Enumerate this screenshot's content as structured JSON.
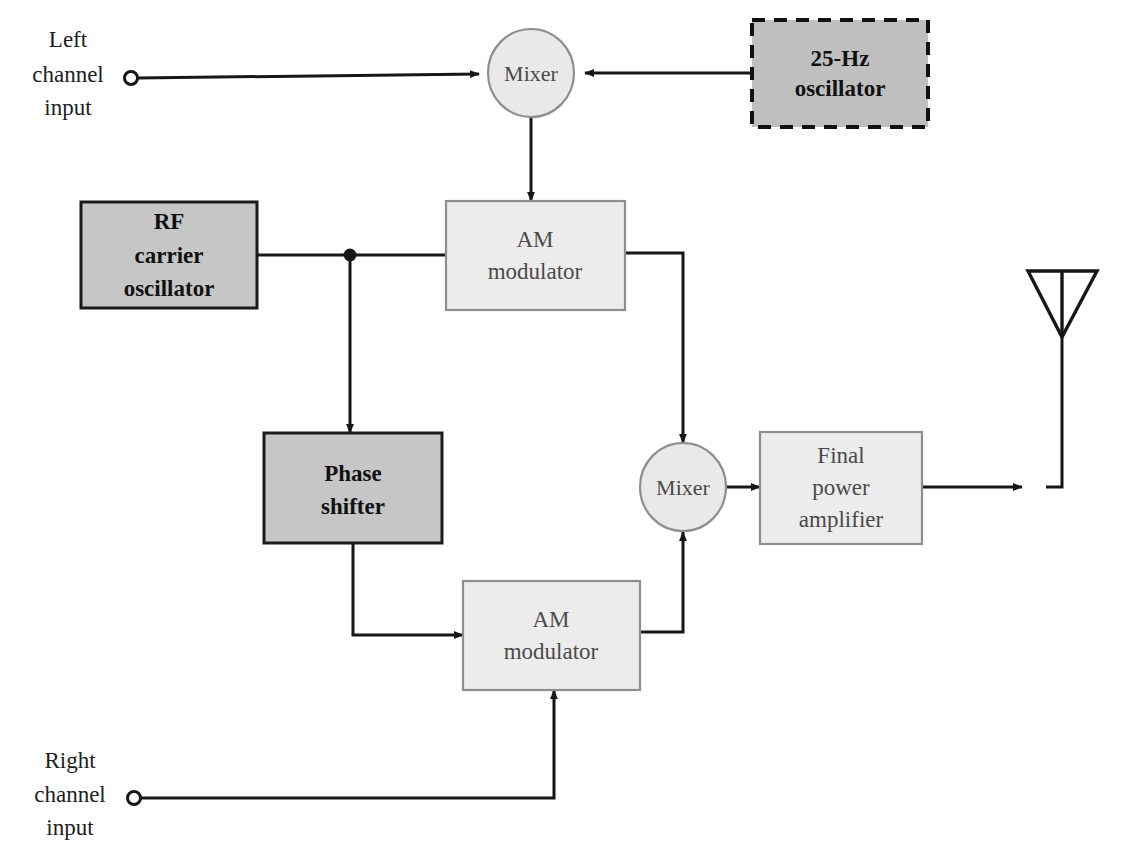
{
  "diagram": {
    "background_color": "#ffffff",
    "colors": {
      "dark_block_fill": "#c6c6c6",
      "dark_block_stroke": "#1a1a1a",
      "light_block_fill": "#ececec",
      "light_block_stroke": "#8e8e8e",
      "wire": "#161616",
      "dark_text": "#111111",
      "light_text": "#4a4a4a"
    },
    "inputs": [
      {
        "id": "left-channel-input",
        "lines": [
          "Left",
          "channel",
          "input"
        ],
        "terminal": {
          "x": 131,
          "y": 78
        }
      },
      {
        "id": "right-channel-input",
        "lines": [
          "Right",
          "channel",
          "input"
        ],
        "terminal": {
          "x": 134,
          "y": 798
        }
      }
    ],
    "blocks": [
      {
        "id": "oscillator-25hz",
        "lines": [
          "25-Hz",
          "oscillator"
        ],
        "style": "dark-dashed",
        "x": 752,
        "y": 20,
        "w": 176,
        "h": 107
      },
      {
        "id": "rf-carrier-oscillator",
        "lines": [
          "RF",
          "carrier",
          "oscillator"
        ],
        "style": "dark",
        "x": 81,
        "y": 202,
        "w": 176,
        "h": 106
      },
      {
        "id": "am-modulator-upper",
        "lines": [
          "AM",
          "modulator"
        ],
        "style": "light",
        "x": 446,
        "y": 201,
        "w": 179,
        "h": 109
      },
      {
        "id": "phase-shifter",
        "lines": [
          "Phase",
          "shifter"
        ],
        "style": "dark",
        "x": 264,
        "y": 433,
        "w": 178,
        "h": 110
      },
      {
        "id": "final-power-amplifier",
        "lines": [
          "Final",
          "power",
          "amplifier"
        ],
        "style": "light",
        "x": 760,
        "y": 432,
        "w": 162,
        "h": 112
      },
      {
        "id": "am-modulator-lower",
        "lines": [
          "AM",
          "modulator"
        ],
        "style": "light",
        "x": 463,
        "y": 581,
        "w": 177,
        "h": 109
      }
    ],
    "nodes": [
      {
        "id": "mixer-upper",
        "label": "Mixer",
        "cx": 531,
        "cy": 73,
        "rx": 43,
        "ry": 44
      },
      {
        "id": "mixer-lower",
        "label": "Mixer",
        "cx": 683,
        "cy": 487,
        "rx": 43,
        "ry": 44
      }
    ],
    "antenna": {
      "id": "antenna",
      "label": "antenna",
      "apex": {
        "x": 1062,
        "y": 337
      },
      "top_left": {
        "x": 1028,
        "y": 271
      },
      "top_right": {
        "x": 1097,
        "y": 271
      },
      "mast_bottom_y": 487
    },
    "junctions": [
      {
        "id": "rf-carrier-junction",
        "x": 350,
        "y": 255,
        "r": 6
      }
    ],
    "connections": [
      {
        "from": "left-channel-input",
        "to": "mixer-upper",
        "arrow": true
      },
      {
        "from": "oscillator-25hz",
        "to": "mixer-upper",
        "arrow": true
      },
      {
        "from": "mixer-upper",
        "to": "am-modulator-upper",
        "arrow": true
      },
      {
        "from": "rf-carrier-oscillator",
        "to": "am-modulator-upper",
        "arrow": false
      },
      {
        "from": "rf-carrier-junction",
        "to": "phase-shifter",
        "arrow": true
      },
      {
        "from": "am-modulator-upper",
        "to": "mixer-lower",
        "arrow": true
      },
      {
        "from": "phase-shifter",
        "to": "am-modulator-lower",
        "arrow": true
      },
      {
        "from": "right-channel-input",
        "to": "am-modulator-lower",
        "arrow": true
      },
      {
        "from": "am-modulator-lower",
        "to": "mixer-lower",
        "arrow": true
      },
      {
        "from": "mixer-lower",
        "to": "final-power-amplifier",
        "arrow": true
      },
      {
        "from": "final-power-amplifier",
        "to": "antenna",
        "arrow": true
      }
    ]
  }
}
